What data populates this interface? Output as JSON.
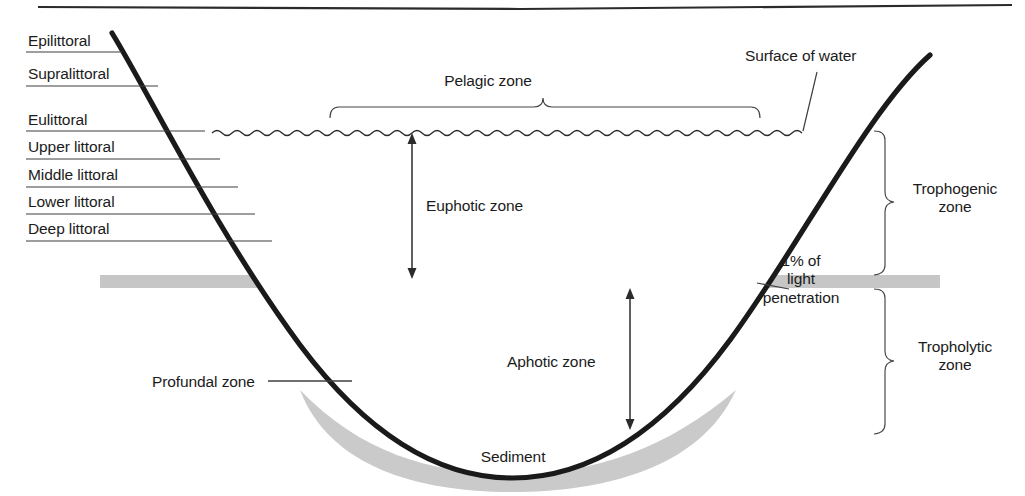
{
  "diagram": {
    "colors": {
      "ink": "#1b1b1b",
      "shore_line": "#1a1a1a",
      "thin_line": "#3a3a3a",
      "sediment_fill": "#c9c9c9",
      "light_band_fill": "#c4c4c4",
      "background": "#ffffff"
    }
  },
  "shore_labels": {
    "items": [
      {
        "label": "Epilittoral",
        "y": 40,
        "line_y": 52,
        "line_x2": 122
      },
      {
        "label": "Supralittoral",
        "y": 73,
        "line_y": 86,
        "line_x2": 158
      },
      {
        "label": "Eulittoral",
        "y": 119,
        "line_y": 131,
        "line_x2": 205
      },
      {
        "label": "Upper littoral",
        "y": 146,
        "line_y": 159,
        "line_x2": 220
      },
      {
        "label": "Middle littoral",
        "y": 174,
        "line_y": 187,
        "line_x2": 238
      },
      {
        "label": "Lower littoral",
        "y": 201,
        "line_y": 214,
        "line_x2": 255
      },
      {
        "label": "Deep littoral",
        "y": 228,
        "line_y": 241,
        "line_x2": 272
      }
    ]
  },
  "zone_labels": {
    "pelagic": "Pelagic zone",
    "euphotic": "Euphotic zone",
    "aphotic": "Aphotic zone",
    "profundal": "Profundal zone",
    "sediment": "Sediment",
    "surface_of_water": "Surface of water",
    "light_penetration_line1": "1% of",
    "light_penetration_line2": "light",
    "light_penetration_line3": "penetration",
    "trophogenic_line1": "Trophogenic",
    "trophogenic_line2": "zone",
    "tropholytic_line1": "Tropholytic",
    "tropholytic_line2": "zone"
  }
}
